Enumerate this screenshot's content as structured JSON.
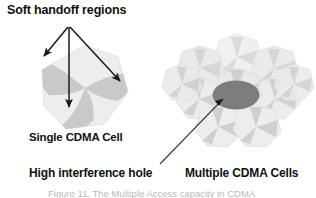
{
  "figure": {
    "width": 316,
    "height": 198,
    "background": "#ffffff",
    "type": "diagram"
  },
  "labels": {
    "soft_handoff": "Soft handoff regions",
    "single_cell": "Single CDMA Cell",
    "high_interference": "High interference hole",
    "multiple_cells": "Multiple CDMA Cells",
    "cut_caption": "Figure 11. The Multiple Access capacity in CDMA"
  },
  "colors": {
    "cell_body": "#ededed",
    "cell_body_alt": "#e4e4e4",
    "handoff_petal": "#c9c9c9",
    "handoff_petal_dark": "#bdbdbd",
    "interference_hole": "#7d7d7d",
    "interference_hole_stroke": "#6e6e6e",
    "arrow": "#1a1a1a",
    "leader_line": "#3a3a3a",
    "text": "#111111",
    "caption_faint": "#b9b9b9"
  },
  "single_cell": {
    "name": "single-cdma-cell",
    "center_x": 85,
    "center_y": 88,
    "radius": 43,
    "petal_count": 3,
    "petal_angles_deg": [
      205,
      325,
      85
    ]
  },
  "cluster": {
    "name": "multiple-cdma-cells",
    "center_x": 237,
    "center_y": 88,
    "cell_radius": 27,
    "cell_count": 7,
    "ring_radius": 40,
    "ring_angles_deg": [
      90,
      150,
      210,
      270,
      330,
      30
    ]
  },
  "interference_hole": {
    "center_x": 236,
    "center_y": 95,
    "radius_x": 23,
    "radius_y": 14
  },
  "arrows": [
    {
      "name": "arrow-handoff-left",
      "from_x": 68,
      "from_y": 27,
      "to_x": 42,
      "to_y": 58
    },
    {
      "name": "arrow-handoff-center",
      "from_x": 69,
      "from_y": 27,
      "to_x": 69,
      "to_y": 110
    },
    {
      "name": "arrow-handoff-right",
      "from_x": 70,
      "from_y": 27,
      "to_x": 123,
      "to_y": 83
    }
  ],
  "leader_line": {
    "name": "leader-interference-hole",
    "from_x": 160,
    "from_y": 164,
    "to_x": 221,
    "to_y": 98
  }
}
